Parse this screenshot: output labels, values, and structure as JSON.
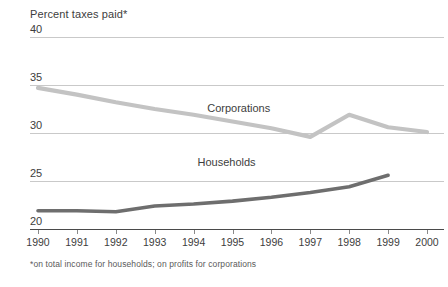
{
  "chart_data": {
    "type": "line",
    "title": "Percent taxes paid*",
    "ylabel": "Percent taxes paid*",
    "xlabel": "",
    "footnote": "*on total income for households; on profits for corporations",
    "x": [
      1990,
      1991,
      1992,
      1993,
      1994,
      1995,
      1996,
      1997,
      1998,
      1999,
      2000
    ],
    "categories": [
      "1990",
      "1991",
      "1992",
      "1993",
      "1994",
      "1995",
      "1996",
      "1997",
      "1998",
      "1999",
      "2000"
    ],
    "ylim": [
      20,
      40
    ],
    "yticks": [
      20,
      25,
      30,
      35,
      40
    ],
    "ytick_labels": [
      "20",
      "25",
      "30",
      "35",
      "40"
    ],
    "grid": true,
    "legend_position": "inline-labels",
    "series": [
      {
        "name": "Corporations",
        "color": "#c3c3c3",
        "label_x": 1994.35,
        "label_y": 32.2,
        "values": [
          34.7,
          34.0,
          33.2,
          32.5,
          31.9,
          31.2,
          30.5,
          29.6,
          31.9,
          30.6,
          30.1
        ]
      },
      {
        "name": "Households",
        "color": "#6e6e6e",
        "label_x": 1994.1,
        "label_y": 26.6,
        "values": [
          21.9,
          21.9,
          21.8,
          22.4,
          22.6,
          22.9,
          23.3,
          23.8,
          24.4,
          25.6,
          null
        ]
      }
    ]
  }
}
